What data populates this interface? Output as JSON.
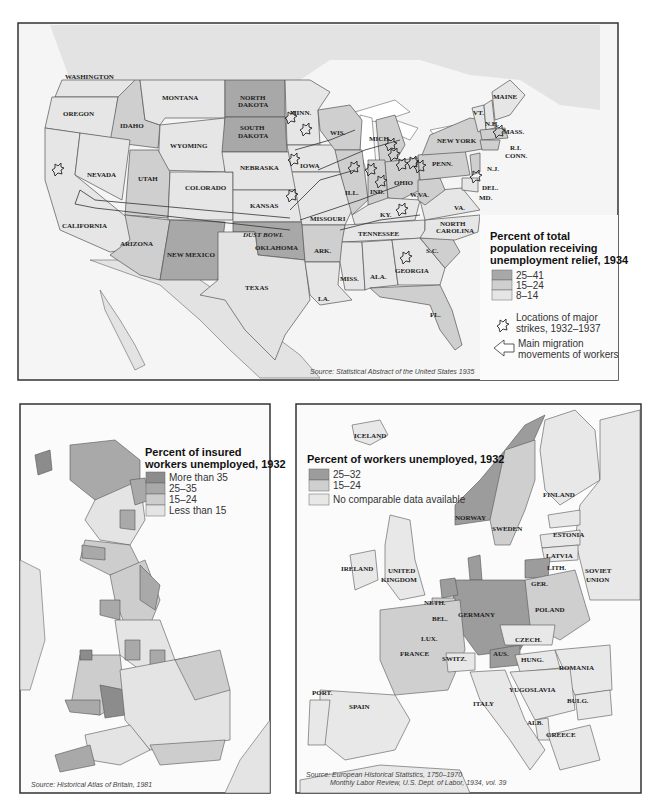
{
  "us_map": {
    "legend": {
      "title_lines": [
        "Percent of total",
        "population receiving",
        "unemployment relief, 1934"
      ],
      "items": [
        {
          "label": "25–41",
          "color": "#a8a8a8"
        },
        {
          "label": "15–24",
          "color": "#cfcfcf"
        },
        {
          "label": "8–14",
          "color": "#e6e6e6"
        }
      ],
      "strikes_label_lines": [
        "Locations of major",
        "strikes, 1932–1937"
      ],
      "migration_label_lines": [
        "Main migration",
        "movements of workers"
      ]
    },
    "source": "Source: Statistical Abstract of the United States 1935",
    "labels": {
      "washington": "WASHINGTON",
      "oregon": "OREGON",
      "idaho": "IDAHO",
      "montana": "MONTANA",
      "wyoming": "WYOMING",
      "nevada": "NEVADA",
      "utah": "UTAH",
      "colorado": "COLORADO",
      "california": "CALIFORNIA",
      "arizona": "ARIZONA",
      "new_mexico": "NEW MEXICO",
      "north_dakota_1": "NORTH",
      "north_dakota_2": "DAKOTA",
      "south_dakota_1": "SOUTH",
      "south_dakota_2": "DAKOTA",
      "nebraska": "NEBRASKA",
      "kansas": "KANSAS",
      "oklahoma": "OKLAHOMA",
      "dust_bowl": "DUST BOWL",
      "texas": "TEXAS",
      "minn": "MINN.",
      "iowa": "IOWA",
      "missouri": "MISSOURI",
      "ark": "ARK.",
      "la": "LA.",
      "wis": "WIS.",
      "ill": "ILL.",
      "mich": "MICH.",
      "ind": "IND.",
      "ohio": "OHIO",
      "ky": "KY.",
      "tennessee": "TENNESSEE",
      "miss": "MISS.",
      "ala": "ALA.",
      "georgia": "GEORGIA",
      "fl": "FL.",
      "sc": "S.C.",
      "north_carolina_1": "NORTH",
      "north_carolina_2": "CAROLINA",
      "va": "VA.",
      "wva": "W.VA.",
      "penn": "PENN.",
      "new_york": "NEW YORK",
      "vt": "VT.",
      "nh": "N.H.",
      "maine": "MAINE",
      "mass": "MASS.",
      "ri": "R.I.",
      "conn": "CONN.",
      "nj": "N.J.",
      "del": "DEL.",
      "md": "MD."
    }
  },
  "britain_map": {
    "legend": {
      "title_lines": [
        "Percent of insured",
        "workers unemployed, 1932"
      ],
      "items": [
        {
          "label": "More than 35",
          "color": "#8c8c8c"
        },
        {
          "label": "25–35",
          "color": "#a9a9a9"
        },
        {
          "label": "15–24",
          "color": "#cdcdcd"
        },
        {
          "label": "Less than 15",
          "color": "#e4e4e4"
        }
      ]
    },
    "source": "Source: Historical Atlas of Britain, 1981"
  },
  "europe_map": {
    "legend": {
      "title": "Percent of workers unemployed, 1932",
      "items": [
        {
          "label": "25–32",
          "color": "#9c9c9c"
        },
        {
          "label": "15–24",
          "color": "#cfcfcf"
        },
        {
          "label": "No comparable data available",
          "color": "#e8e8e8"
        }
      ]
    },
    "source_lines": [
      "Source: European Historical Statistics, 1750–1970",
      "Monthly Labor Review, U.S. Dept. of Labor, 1934, vol. 39"
    ],
    "labels": {
      "iceland": "ICELAND",
      "norway": "NORWAY",
      "sweden": "SWEDEN",
      "finland": "FINLAND",
      "estonia": "ESTONIA",
      "latvia": "LATVIA",
      "lith": "LITH.",
      "soviet_1": "SOVIET",
      "soviet_2": "UNION",
      "ireland": "IRELAND",
      "uk_1": "UNITED",
      "uk_2": "KINGDOM",
      "neth": "NETH.",
      "bel": "BEL.",
      "lux": "LUX.",
      "germany": "GERMANY",
      "ger": "GER.",
      "poland": "POLAND",
      "czech": "CZECH.",
      "aus": "AUS.",
      "hung": "HUNG.",
      "romania": "ROMANIA",
      "switz": "SWITZ.",
      "france": "FRANCE",
      "port": "PORT.",
      "spain": "SPAIN",
      "italy": "ITALY",
      "yugoslavia": "YUGOSLAVIA",
      "bulg": "BULG.",
      "alb": "ALB.",
      "greece": "GREECE"
    }
  }
}
